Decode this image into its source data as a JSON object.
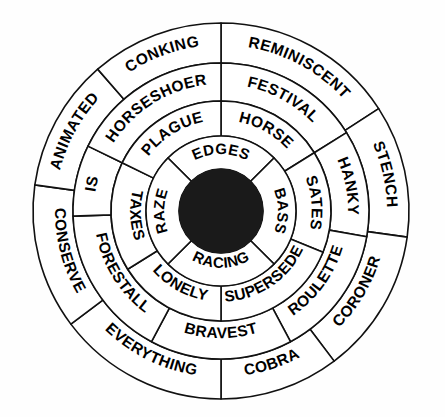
{
  "figure": {
    "type": "concentric-word-wheel",
    "title": "",
    "background_color": "#ffffff",
    "stroke_color": "#111111",
    "hub_color": "#1a1a1a",
    "label_color": "#000000",
    "center": {
      "x": 221,
      "y": 211
    },
    "hub_radius": 42
  },
  "rings": [
    {
      "id": "ring-1",
      "name": "outer-ring",
      "index": 1,
      "inner_radius": 148,
      "outer_radius": 188,
      "segment_count": 8,
      "segments": [
        {
          "label": "REMINISCENT",
          "start_deg": 0,
          "end_deg": 57
        },
        {
          "label": "STENCH",
          "start_deg": 57,
          "end_deg": 98
        },
        {
          "label": "CORONER",
          "start_deg": 98,
          "end_deg": 143
        },
        {
          "label": "COBRA",
          "start_deg": 143,
          "end_deg": 180
        },
        {
          "label": "EVERYTHING",
          "start_deg": 180,
          "end_deg": 233
        },
        {
          "label": "CONSERVE",
          "start_deg": 233,
          "end_deg": 278
        },
        {
          "label": "ANIMATED",
          "start_deg": 278,
          "end_deg": 319
        },
        {
          "label": "CONKING",
          "start_deg": 319,
          "end_deg": 360
        }
      ]
    },
    {
      "id": "ring-2",
      "name": "second-ring",
      "index": 2,
      "inner_radius": 110,
      "outer_radius": 148,
      "segment_count": 7,
      "segments": [
        {
          "label": "FESTIVAL",
          "start_deg": 0,
          "end_deg": 58
        },
        {
          "label": "HANKY",
          "start_deg": 58,
          "end_deg": 100
        },
        {
          "label": "ROULETTE",
          "start_deg": 100,
          "end_deg": 152
        },
        {
          "label": "BRAVEST",
          "start_deg": 152,
          "end_deg": 208
        },
        {
          "label": "FORESTALL",
          "start_deg": 208,
          "end_deg": 268
        },
        {
          "label": "IS",
          "start_deg": 268,
          "end_deg": 296
        },
        {
          "label": "HORSESHOER",
          "start_deg": 296,
          "end_deg": 360
        }
      ]
    },
    {
      "id": "ring-3",
      "name": "third-ring",
      "index": 3,
      "inner_radius": 75,
      "outer_radius": 110,
      "segment_count": 6,
      "segments": [
        {
          "label": "HORSE",
          "start_deg": 0,
          "end_deg": 58
        },
        {
          "label": "SATES",
          "start_deg": 58,
          "end_deg": 112
        },
        {
          "label": "SUPERSEDE",
          "start_deg": 112,
          "end_deg": 180
        },
        {
          "label": "LONELY",
          "start_deg": 180,
          "end_deg": 238
        },
        {
          "label": "TAXES",
          "start_deg": 238,
          "end_deg": 296
        },
        {
          "label": "PLAGUE",
          "start_deg": 296,
          "end_deg": 360
        }
      ]
    },
    {
      "id": "ring-4",
      "name": "inner-ring",
      "index": 4,
      "inner_radius": 42,
      "outer_radius": 75,
      "segment_count": 4,
      "segments": [
        {
          "label": "EDGES",
          "start_deg": 315,
          "end_deg": 45
        },
        {
          "label": "BASS",
          "start_deg": 45,
          "end_deg": 135
        },
        {
          "label": "RACING",
          "start_deg": 135,
          "end_deg": 225
        },
        {
          "label": "RAZE",
          "start_deg": 225,
          "end_deg": 315
        }
      ]
    }
  ],
  "all_words": [
    "REMINISCENT",
    "STENCH",
    "CORONER",
    "COBRA",
    "EVERYTHING",
    "CONSERVE",
    "ANIMATED",
    "CONKING",
    "FESTIVAL",
    "HANKY",
    "ROULETTE",
    "BRAVEST",
    "FORESTALL",
    "IS",
    "HORSESHOER",
    "HORSE",
    "SATES",
    "SUPERSEDE",
    "LONELY",
    "TAXES",
    "PLAGUE",
    "EDGES",
    "BASS",
    "RACING",
    "RAZE"
  ]
}
